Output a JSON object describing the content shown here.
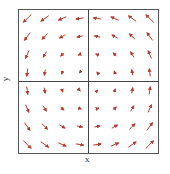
{
  "chart_data": {
    "type": "quiver",
    "title": "",
    "xlabel": "x",
    "ylabel": "y",
    "xlim": [
      -1,
      1
    ],
    "ylim": [
      -1,
      1
    ],
    "grid": false,
    "legend": null,
    "field": "counterclockwise rotation, v = (-y, x)",
    "grid_points": {
      "x": [
        -0.875,
        -0.625,
        -0.375,
        -0.125,
        0.125,
        0.375,
        0.625,
        0.875
      ],
      "y": [
        0.875,
        0.625,
        0.375,
        0.125,
        -0.125,
        -0.375,
        -0.625,
        -0.875
      ]
    },
    "arrow_color": "#c0392b",
    "axes_lines": {
      "x0": true,
      "y0": true
    }
  },
  "axes": {
    "x_label": "x",
    "y_label": "y"
  }
}
